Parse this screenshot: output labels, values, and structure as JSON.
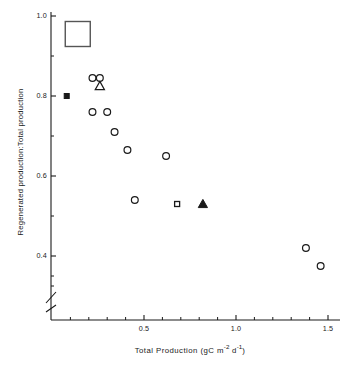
{
  "figure": {
    "background_color": "#ffffff",
    "ink_color": "#1a1a1a"
  },
  "axes": {
    "y_title": "Regenerated production:Total production",
    "x_title_text": "Total Production (gC m",
    "x_title_sup1": "-2",
    "x_title_mid": " d",
    "x_title_sup2": "-1",
    "x_title_end": ")",
    "y_tick_labels": [
      "1.0",
      "0.8",
      "0.6",
      "0.4"
    ],
    "x_tick_labels": [
      "0.5",
      "1.0",
      "1.5"
    ],
    "axis_break": "y-axis-break-zigzag"
  },
  "legend": {
    "box_marker": "open-square-large"
  },
  "chart_data": {
    "type": "scatter",
    "title": "",
    "xlabel": "Total Production (gC m-2 d-1)",
    "ylabel": "Regenerated production:Total production",
    "xlim": [
      0.0,
      1.55
    ],
    "ylim": [
      0.3,
      1.0
    ],
    "y_ticks": [
      0.4,
      0.6,
      0.8,
      1.0
    ],
    "y_minor_ticks": [
      0.5,
      0.7,
      0.9
    ],
    "x_ticks": [
      0.5,
      1.0,
      1.5
    ],
    "x_minor_ticks": [
      0.1,
      0.2,
      0.3,
      0.4,
      0.6,
      0.7,
      0.8,
      0.9,
      1.1,
      1.2,
      1.3,
      1.4
    ],
    "grid": false,
    "legend_position": "none",
    "axis_break_y": true,
    "series": [
      {
        "name": "open circle",
        "marker": "open-circle",
        "points": [
          {
            "x": 0.22,
            "y": 0.845
          },
          {
            "x": 0.26,
            "y": 0.845
          },
          {
            "x": 0.22,
            "y": 0.76
          },
          {
            "x": 0.3,
            "y": 0.76
          },
          {
            "x": 0.34,
            "y": 0.71
          },
          {
            "x": 0.41,
            "y": 0.665
          },
          {
            "x": 0.62,
            "y": 0.65
          },
          {
            "x": 0.45,
            "y": 0.54
          },
          {
            "x": 1.38,
            "y": 0.42
          },
          {
            "x": 1.46,
            "y": 0.375
          }
        ]
      },
      {
        "name": "filled square",
        "marker": "filled-square",
        "points": [
          {
            "x": 0.08,
            "y": 0.8
          }
        ]
      },
      {
        "name": "open triangle",
        "marker": "open-triangle",
        "points": [
          {
            "x": 0.26,
            "y": 0.825
          }
        ]
      },
      {
        "name": "open square",
        "marker": "open-square",
        "points": [
          {
            "x": 0.68,
            "y": 0.53
          }
        ]
      },
      {
        "name": "filled triangle",
        "marker": "filled-triangle",
        "points": [
          {
            "x": 0.82,
            "y": 0.53
          }
        ]
      },
      {
        "name": "legend box",
        "marker": "open-square-large",
        "points": [
          {
            "x": 0.14,
            "y": 0.955
          }
        ]
      }
    ]
  }
}
